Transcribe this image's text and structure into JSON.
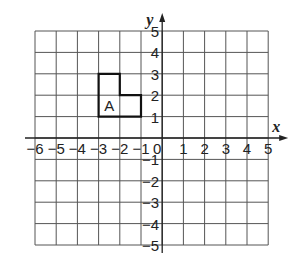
{
  "diagram": {
    "type": "coordinate-grid",
    "axes": {
      "x_label": "x",
      "y_label": "y"
    },
    "x_range": [
      -6,
      5
    ],
    "y_range": [
      -5,
      5
    ],
    "x_ticks": [
      "−6",
      "−5",
      "−4",
      "−3",
      "−2",
      "−1",
      "0",
      "1",
      "2",
      "3",
      "4",
      "5"
    ],
    "y_ticks": [
      "5",
      "4",
      "3",
      "2",
      "1",
      "−1",
      "−2",
      "−3",
      "−4",
      "−5"
    ],
    "shape": {
      "label": "A",
      "vertices": [
        [
          -3,
          1
        ],
        [
          -3,
          3
        ],
        [
          -2,
          3
        ],
        [
          -2,
          2
        ],
        [
          -1,
          2
        ],
        [
          -1,
          1
        ]
      ]
    }
  }
}
